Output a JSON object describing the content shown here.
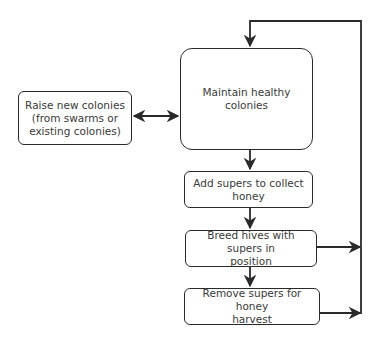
{
  "diagram": {
    "type": "flowchart",
    "nodes": [
      {
        "id": "maintain",
        "label": "Maintain healthy colonies"
      },
      {
        "id": "raise",
        "label": "Raise new colonies\n(from swarms or\nexisting colonies)"
      },
      {
        "id": "add",
        "label": "Add supers to collect\nhoney"
      },
      {
        "id": "breed",
        "label": "Breed hives with supers in\nposition"
      },
      {
        "id": "remove",
        "label": "Remove supers for honey\nharvest"
      }
    ],
    "edges": [
      {
        "from": "raise",
        "to": "maintain",
        "bidirectional": true
      },
      {
        "from": "maintain",
        "to": "add"
      },
      {
        "from": "add",
        "to": "breed"
      },
      {
        "from": "breed",
        "to": "remove"
      },
      {
        "from": "breed",
        "to": "maintain",
        "via": "right-loop"
      },
      {
        "from": "remove",
        "to": "maintain",
        "via": "right-loop"
      }
    ],
    "colors": {
      "stroke": "#2a2a2a",
      "text": "#3a3a3a",
      "background": "#ffffff"
    }
  }
}
